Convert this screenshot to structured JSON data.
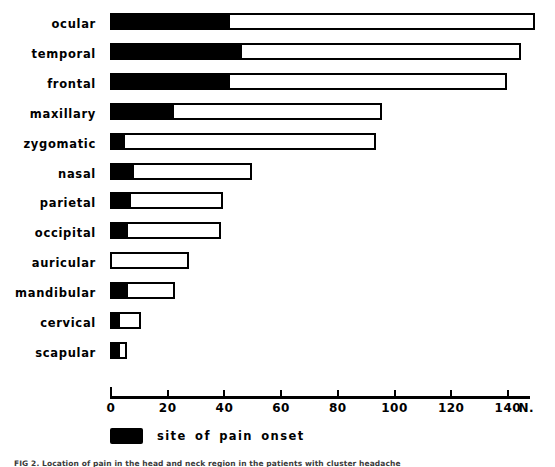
{
  "chart_data": {
    "type": "bar",
    "title": "",
    "orientation": "horizontal",
    "stacked": true,
    "xlabel": "N.",
    "ylabel": "",
    "xlim": [
      0,
      148
    ],
    "grid": false,
    "legend_position": "bottom-left",
    "categories": [
      "ocular",
      "temporal",
      "frontal",
      "maxillary",
      "zygomatic",
      "nasal",
      "parietal",
      "occipital",
      "auricular",
      "mandibular",
      "cervical",
      "scapular"
    ],
    "series": [
      {
        "name": "site of pain onset",
        "style": "filled-black",
        "values": [
          41,
          45,
          41,
          21,
          4,
          7,
          6,
          5,
          0,
          5,
          2,
          2
        ]
      },
      {
        "name": "total",
        "style": "outline-white",
        "values": [
          150,
          145,
          140,
          96,
          94,
          50,
          40,
          39,
          28,
          23,
          11,
          6
        ]
      }
    ],
    "xticks": [
      0,
      20,
      40,
      60,
      80,
      100,
      120,
      140
    ],
    "xtick_labels": [
      "0",
      "20",
      "40",
      "60",
      "80",
      "100",
      "120",
      "140"
    ],
    "axis_unit_label": "N."
  },
  "legend": {
    "label": "site of pain onset"
  },
  "caption": {
    "text": "FIG 2. Location of pain in the head and neck region in the patients with cluster headache"
  }
}
